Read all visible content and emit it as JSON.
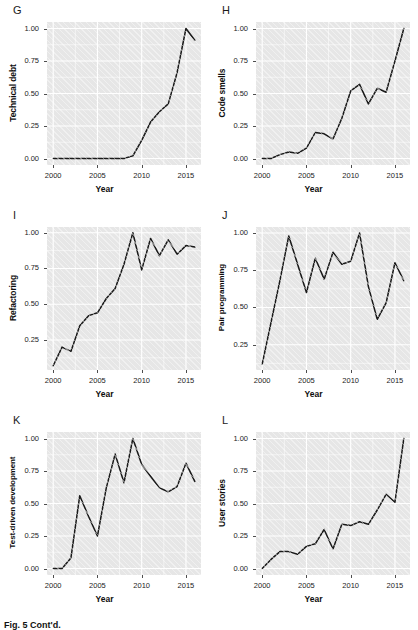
{
  "figure": {
    "panel_count": 6,
    "x_axis_label": "Year",
    "x_ticks": [
      "2000",
      "2005",
      "2010",
      "2015"
    ],
    "caption": "Fig. 5   Cont'd."
  },
  "chart_data": [
    {
      "type": "line",
      "panel": "G",
      "title": "",
      "ylabel": "Technical debt",
      "xlabel": "Year",
      "xlim": [
        1999.3,
        2016.7
      ],
      "ylim": [
        -0.05,
        1.05
      ],
      "xticks": [
        2000,
        2005,
        2010,
        2015
      ],
      "yticks": [
        0.0,
        0.25,
        0.5,
        0.75,
        1.0
      ],
      "ytick_labels": [
        "0.00",
        "0.25",
        "0.50",
        "0.75",
        "1.00"
      ],
      "grid": true,
      "legend": "none",
      "x": [
        2000,
        2001,
        2002,
        2003,
        2004,
        2005,
        2006,
        2007,
        2008,
        2009,
        2010,
        2011,
        2012,
        2013,
        2014,
        2015,
        2016
      ],
      "values": [
        0.0,
        0.0,
        0.0,
        0.0,
        0.0,
        0.0,
        0.0,
        0.0,
        0.0,
        0.02,
        0.14,
        0.28,
        0.36,
        0.42,
        0.66,
        1.0,
        0.91
      ]
    },
    {
      "type": "line",
      "panel": "H",
      "title": "",
      "ylabel": "Code smells",
      "xlabel": "Year",
      "xlim": [
        1999.3,
        2016.7
      ],
      "ylim": [
        -0.05,
        1.05
      ],
      "xticks": [
        2000,
        2005,
        2010,
        2015
      ],
      "yticks": [
        0.0,
        0.25,
        0.5,
        0.75,
        1.0
      ],
      "ytick_labels": [
        "0.00",
        "0.25",
        "0.50",
        "0.75",
        "1.00"
      ],
      "grid": true,
      "legend": "none",
      "x": [
        2000,
        2001,
        2002,
        2003,
        2004,
        2005,
        2006,
        2007,
        2008,
        2009,
        2010,
        2011,
        2012,
        2013,
        2014,
        2015,
        2016
      ],
      "values": [
        0.0,
        0.0,
        0.03,
        0.05,
        0.04,
        0.08,
        0.2,
        0.19,
        0.15,
        0.31,
        0.52,
        0.57,
        0.42,
        0.54,
        0.51,
        0.75,
        1.0
      ]
    },
    {
      "type": "line",
      "panel": "I",
      "title": "",
      "ylabel": "Refactoring",
      "xlabel": "Year",
      "xlim": [
        1999.3,
        2016.7
      ],
      "ylim": [
        0.04,
        1.04
      ],
      "xticks": [
        2000,
        2005,
        2010,
        2015
      ],
      "yticks": [
        0.25,
        0.5,
        0.75,
        1.0
      ],
      "ytick_labels": [
        "0.25",
        "0.50",
        "0.75",
        "1.00"
      ],
      "grid": true,
      "legend": "none",
      "x": [
        2000,
        2001,
        2002,
        2003,
        2004,
        2005,
        2006,
        2007,
        2008,
        2009,
        2010,
        2011,
        2012,
        2013,
        2014,
        2015,
        2016
      ],
      "values": [
        0.07,
        0.2,
        0.17,
        0.35,
        0.42,
        0.44,
        0.54,
        0.61,
        0.78,
        1.0,
        0.74,
        0.96,
        0.84,
        0.95,
        0.85,
        0.91,
        0.9
      ]
    },
    {
      "type": "line",
      "panel": "J",
      "title": "",
      "ylabel": "Pair programming",
      "xlabel": "Year",
      "xlim": [
        1999.3,
        2016.7
      ],
      "ylim": [
        0.08,
        1.04
      ],
      "xticks": [
        2000,
        2005,
        2010,
        2015
      ],
      "yticks": [
        0.25,
        0.5,
        0.75,
        1.0
      ],
      "ytick_labels": [
        "0.25",
        "0.50",
        "0.75",
        "1.00"
      ],
      "grid": true,
      "legend": "none",
      "x": [
        2000,
        2001,
        2002,
        2003,
        2004,
        2005,
        2006,
        2007,
        2008,
        2009,
        2010,
        2011,
        2012,
        2013,
        2014,
        2015,
        2016
      ],
      "values": [
        0.12,
        0.4,
        0.68,
        0.98,
        0.79,
        0.6,
        0.83,
        0.69,
        0.87,
        0.79,
        0.81,
        1.0,
        0.64,
        0.42,
        0.53,
        0.8,
        0.68
      ]
    },
    {
      "type": "line",
      "panel": "K",
      "title": "",
      "ylabel": "Test-driven development",
      "xlabel": "Year",
      "xlim": [
        1999.3,
        2016.7
      ],
      "ylim": [
        -0.05,
        1.05
      ],
      "xticks": [
        2000,
        2005,
        2010,
        2015
      ],
      "yticks": [
        0.0,
        0.25,
        0.5,
        0.75,
        1.0
      ],
      "ytick_labels": [
        "0.00",
        "0.25",
        "0.50",
        "0.75",
        "1.00"
      ],
      "grid": true,
      "legend": "none",
      "x": [
        2000,
        2001,
        2002,
        2003,
        2004,
        2005,
        2006,
        2007,
        2008,
        2009,
        2010,
        2011,
        2012,
        2013,
        2014,
        2015,
        2016
      ],
      "values": [
        0.0,
        0.0,
        0.08,
        0.56,
        0.4,
        0.25,
        0.62,
        0.88,
        0.66,
        1.0,
        0.8,
        0.71,
        0.62,
        0.59,
        0.63,
        0.81,
        0.67
      ]
    },
    {
      "type": "line",
      "panel": "L",
      "title": "",
      "ylabel": "User stories",
      "xlabel": "Year",
      "xlim": [
        1999.3,
        2016.7
      ],
      "ylim": [
        -0.05,
        1.05
      ],
      "xticks": [
        2000,
        2005,
        2010,
        2015
      ],
      "yticks": [
        0.0,
        0.25,
        0.5,
        0.75,
        1.0
      ],
      "ytick_labels": [
        "0.00",
        "0.25",
        "0.50",
        "0.75",
        "1.00"
      ],
      "grid": true,
      "legend": "none",
      "x": [
        2000,
        2001,
        2002,
        2003,
        2004,
        2005,
        2006,
        2007,
        2008,
        2009,
        2010,
        2011,
        2012,
        2013,
        2014,
        2015,
        2016
      ],
      "values": [
        0.0,
        0.07,
        0.13,
        0.13,
        0.11,
        0.17,
        0.19,
        0.3,
        0.15,
        0.34,
        0.33,
        0.36,
        0.34,
        0.45,
        0.57,
        0.51,
        1.0
      ]
    }
  ],
  "style": {
    "panel_bg": "#e6e6e6",
    "grid_color": "#ffffff",
    "line_color": "#1a1a1a",
    "text_color": "#000000"
  }
}
